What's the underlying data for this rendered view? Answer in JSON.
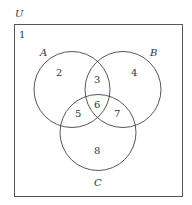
{
  "universe": {
    "label": "U",
    "region_outside": "1"
  },
  "sets": [
    {
      "label": "A"
    },
    {
      "label": "B"
    },
    {
      "label": "C"
    }
  ],
  "regions": {
    "outside": "1",
    "A_only": "2",
    "A_and_B_only": "3",
    "B_only": "4",
    "A_and_C_only": "5",
    "A_and_B_and_C": "6",
    "B_and_C_only": "7",
    "C_only": "8"
  }
}
